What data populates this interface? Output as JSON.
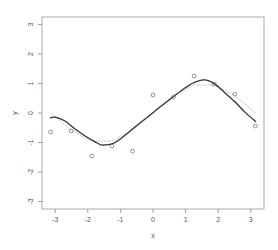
{
  "chart_data": {
    "type": "scatter",
    "title": "",
    "xlabel": "x",
    "ylabel": "y",
    "xlim": [
      -3.3,
      3.4
    ],
    "ylim": [
      -3.3,
      3.3
    ],
    "grid": false,
    "legend": null,
    "x_ticks": [
      -3,
      -2,
      -1,
      0,
      1,
      2,
      3
    ],
    "x_tick_labels": [
      "-3",
      "-2",
      "-1",
      "0",
      "1",
      "2",
      "3"
    ],
    "y_ticks": [
      -3,
      -2,
      -1,
      0,
      1,
      2,
      3
    ],
    "y_tick_labels": [
      "-3",
      "-2",
      "-1",
      "0",
      "1",
      "2",
      "3"
    ],
    "series": [
      {
        "name": "observations",
        "kind": "points",
        "marker": "open-circle",
        "x": [
          -3.14,
          -2.51,
          -1.88,
          -1.26,
          -0.63,
          0.0,
          0.63,
          1.26,
          1.88,
          2.51,
          3.14
        ],
        "y": [
          -0.64,
          -0.61,
          -1.46,
          -1.12,
          -1.29,
          0.61,
          0.54,
          1.25,
          0.98,
          0.64,
          -0.44
        ]
      },
      {
        "name": "true-function",
        "kind": "line",
        "style": "dotted",
        "color": "#aaaaaa",
        "x": [
          -3.14,
          -2.51,
          -1.88,
          -1.26,
          -0.63,
          0.0,
          0.63,
          1.26,
          1.88,
          2.51,
          3.14
        ],
        "y": [
          0.0,
          -0.59,
          -0.95,
          -0.95,
          -0.59,
          0.0,
          0.59,
          0.95,
          0.95,
          0.59,
          0.0
        ]
      },
      {
        "name": "fitted-curve",
        "kind": "line",
        "style": "solid",
        "color": "#333333",
        "x": [
          -3.16,
          -3.0,
          -2.7,
          -2.39,
          -2.08,
          -1.78,
          -1.6,
          -1.47,
          -1.26,
          -1.0,
          -0.7,
          -0.4,
          -0.09,
          0.21,
          0.61,
          0.98,
          1.29,
          1.6,
          1.9,
          2.21,
          2.52,
          2.82,
          3.16
        ],
        "y": [
          -0.17,
          -0.14,
          -0.27,
          -0.54,
          -0.78,
          -0.98,
          -1.08,
          -1.08,
          -1.05,
          -0.88,
          -0.61,
          -0.34,
          -0.07,
          0.2,
          0.54,
          0.85,
          1.05,
          1.12,
          0.98,
          0.68,
          0.37,
          0.03,
          -0.3
        ]
      }
    ]
  }
}
